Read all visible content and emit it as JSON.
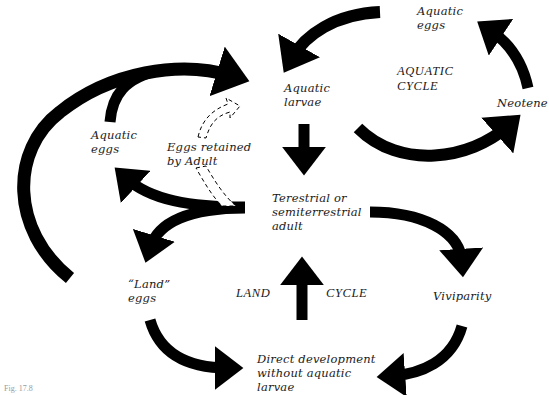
{
  "diagram": {
    "nodes": {
      "aquatic_eggs_top": "Aquatic\neggs",
      "aquatic_larvae": "Aquatic\nlarvae",
      "neotene": "Neotene",
      "aquatic_eggs_left": "Aquatic\neggs",
      "eggs_retained": "Eggs retained\nby Adult",
      "adult": "Terestrial or\nsemiterrestrial\nadult",
      "land_eggs": "“Land”\neggs",
      "viviparity": "Viviparity",
      "direct_development": "Direct development\nwithout aquatic\nlarvae"
    },
    "cycles": {
      "aquatic": "AQUATIC\nCYCLE",
      "land": "LAND",
      "land_cycle": "CYCLE"
    },
    "caption_fragment": "Fig. 17.8"
  }
}
